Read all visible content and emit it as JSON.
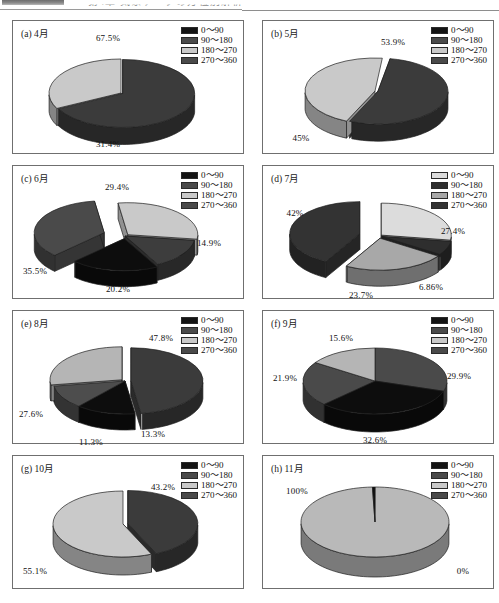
{
  "header": {
    "block_label": "header-bar",
    "title_fragment": "第4章 気象データの方位別解析",
    "rule": "horizontal-rule"
  },
  "legend_labels": [
    "0〜90",
    "90〜180",
    "180〜270",
    "270〜360"
  ],
  "palette": {
    "black": "#141414",
    "dark_gray": "#4a4a4a",
    "mid_gray": "#8f8f8f",
    "light_gray": "#c9c9c9",
    "very_light_gray": "#dcdcdc",
    "outline": "#2a2a2a",
    "panel_border": "#6f6f6f"
  },
  "chart_data": [
    {
      "id": "a",
      "type": "pie",
      "title": "(a) 4月",
      "categories": [
        "0〜90",
        "90〜180",
        "180〜270",
        "270〜360"
      ],
      "values": [
        0,
        67.5,
        31.4,
        0
      ],
      "labels": [
        "",
        "67.5%",
        "31.4%",
        ""
      ],
      "legend_colors": [
        "#141414",
        "#4a4a4a",
        "#c9c9c9",
        "#4a4a4a"
      ],
      "legend_position": "top-right",
      "exploded": true
    },
    {
      "id": "b",
      "type": "pie",
      "title": "(b) 5月",
      "categories": [
        "0〜90",
        "90〜180",
        "180〜270",
        "270〜360"
      ],
      "values": [
        0,
        53.9,
        45,
        0
      ],
      "labels": [
        "",
        "53.9%",
        "45%",
        ""
      ],
      "legend_colors": [
        "#141414",
        "#4a4a4a",
        "#c9c9c9",
        "#4a4a4a"
      ],
      "legend_position": "top-right",
      "exploded": true
    },
    {
      "id": "c",
      "type": "pie",
      "title": "(c) 6月",
      "categories": [
        "0〜90",
        "90〜180",
        "180〜270",
        "270〜360"
      ],
      "values": [
        14.9,
        20.2,
        29.4,
        35.5
      ],
      "labels": [
        "14.9%",
        "20.2%",
        "29.4%",
        "35.5%"
      ],
      "legend_colors": [
        "#141414",
        "#4a4a4a",
        "#c9c9c9",
        "#4a4a4a"
      ],
      "legend_position": "top-right",
      "exploded": true
    },
    {
      "id": "d",
      "type": "pie",
      "title": "(d) 7月",
      "categories": [
        "0〜90",
        "90〜180",
        "180〜270",
        "270〜360"
      ],
      "values": [
        27.4,
        6.86,
        23.7,
        42
      ],
      "labels": [
        "27.4%",
        "6.86%",
        "23.7%",
        "42%"
      ],
      "legend_colors": [
        "#dcdcdc",
        "#2e2e2e",
        "#a8a8a8",
        "#333333"
      ],
      "legend_position": "top-right",
      "exploded": true
    },
    {
      "id": "e",
      "type": "pie",
      "title": "(e) 8月",
      "categories": [
        "0〜90",
        "90〜180",
        "180〜270",
        "270〜360"
      ],
      "values": [
        13.3,
        11.3,
        27.6,
        47.8
      ],
      "labels": [
        "13.3%",
        "11.3%",
        "27.6%",
        "47.8%"
      ],
      "legend_colors": [
        "#141414",
        "#4a4a4a",
        "#c9c9c9",
        "#4a4a4a"
      ],
      "legend_position": "top-right",
      "exploded": true
    },
    {
      "id": "f",
      "type": "pie",
      "title": "(f) 9月",
      "categories": [
        "0〜90",
        "90〜180",
        "180〜270",
        "270〜360"
      ],
      "values": [
        32.6,
        29.9,
        15.6,
        21.9
      ],
      "labels": [
        "32.6%",
        "29.9%",
        "15.6%",
        "21.9%"
      ],
      "legend_colors": [
        "#141414",
        "#4a4a4a",
        "#c9c9c9",
        "#4a4a4a"
      ],
      "legend_position": "top-right",
      "exploded": false
    },
    {
      "id": "g",
      "type": "pie",
      "title": "(g) 10月",
      "categories": [
        "0〜90",
        "90〜180",
        "180〜270",
        "270〜360"
      ],
      "values": [
        0,
        43.2,
        55.1,
        0
      ],
      "labels": [
        "",
        "43.2%",
        "55.1%",
        ""
      ],
      "legend_colors": [
        "#141414",
        "#4a4a4a",
        "#c9c9c9",
        "#4a4a4a"
      ],
      "legend_position": "top-right",
      "exploded": true
    },
    {
      "id": "h",
      "type": "pie",
      "title": "(h) 11月",
      "categories": [
        "0〜90",
        "90〜180",
        "180〜270",
        "270〜360"
      ],
      "values": [
        0,
        0,
        100,
        0
      ],
      "labels": [
        "0%",
        "",
        "100%",
        ""
      ],
      "legend_colors": [
        "#141414",
        "#4a4a4a",
        "#c9c9c9",
        "#4a4a4a"
      ],
      "legend_position": "top-right",
      "exploded": false
    }
  ]
}
